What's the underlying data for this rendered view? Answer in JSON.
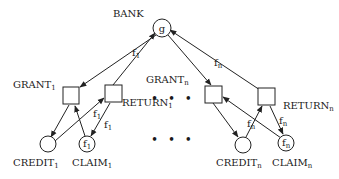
{
  "diagram": {
    "type": "petri-net",
    "colors": {
      "stroke": "#222222",
      "background": "#ffffff",
      "text": "#1a1a1a"
    },
    "places": {
      "bank": {
        "label": "BANK",
        "token": "g"
      },
      "credit_1": {
        "label": "CREDIT",
        "sub": "1",
        "token": ""
      },
      "claim_1": {
        "label": "CLAIM",
        "sub": "1",
        "token": "f",
        "token_sub": "1"
      },
      "credit_n": {
        "label": "CREDIT",
        "sub": "n",
        "token": ""
      },
      "claim_n": {
        "label": "CLAIM",
        "sub": "n",
        "token": "f",
        "token_sub": "n"
      }
    },
    "transitions": {
      "grant_1": {
        "label": "GRANT",
        "sub": "1"
      },
      "return_1": {
        "label": "RETURN",
        "sub": "1"
      },
      "grant_n": {
        "label": "GRANT",
        "sub": "n"
      },
      "return_n": {
        "label": "RETURN",
        "sub": "n"
      }
    },
    "arc_labels": {
      "return1_to_bank": {
        "text": "f",
        "sub": "1"
      },
      "claim1_to_return1": {
        "text": "f",
        "sub": "1"
      },
      "return1_to_claim1": {
        "text": "f",
        "sub": "1"
      },
      "bank_to_returnn": {
        "text": "f",
        "sub": "n"
      },
      "creditn_to_returnn": {
        "text": "f",
        "sub": "n"
      },
      "returnn_to_claimn": {
        "text": "f",
        "sub": "n"
      }
    },
    "ellipsis": {
      "upper": "• • •",
      "lower": "• • •"
    }
  }
}
